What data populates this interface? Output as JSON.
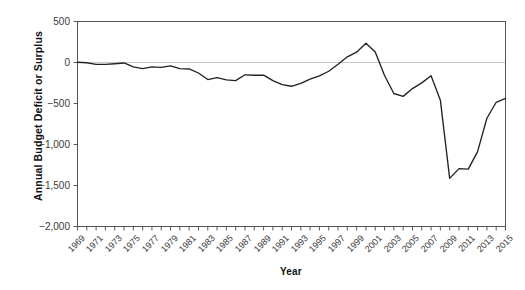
{
  "chart_data": {
    "type": "line",
    "title": "",
    "xlabel": "Year",
    "ylabel": "Annual Budget Deficit or Surplus",
    "xlim": [
      1969,
      2015
    ],
    "ylim": [
      -2000,
      500
    ],
    "grid": false,
    "legend": "none",
    "y_ticks": [
      500,
      0,
      -500,
      -1000,
      -1500,
      -2000
    ],
    "y_tick_labels": [
      "500",
      "0",
      "−500",
      "−1,000",
      "−1,500",
      "−2,000"
    ],
    "x_tick_labels": [
      "1969",
      "1971",
      "1973",
      "1975",
      "1977",
      "1979",
      "1981",
      "1983",
      "1985",
      "1987",
      "1989",
      "1991",
      "1993",
      "1995",
      "1997",
      "1999",
      "2001",
      "2003",
      "2005",
      "2007",
      "2009",
      "2011",
      "2013",
      "2015"
    ],
    "x_tick_label_step": 2,
    "series": [
      {
        "name": "Annual Budget Deficit or Surplus",
        "color": "#222222",
        "x": [
          1969,
          1970,
          1971,
          1972,
          1973,
          1974,
          1975,
          1976,
          1977,
          1978,
          1979,
          1980,
          1981,
          1982,
          1983,
          1984,
          1985,
          1986,
          1987,
          1988,
          1989,
          1990,
          1991,
          1992,
          1993,
          1994,
          1995,
          1996,
          1997,
          1998,
          1999,
          2000,
          2001,
          2002,
          2003,
          2004,
          2005,
          2006,
          2007,
          2008,
          2009,
          2010,
          2011,
          2012,
          2013,
          2014,
          2015
        ],
        "values": [
          3,
          -3,
          -23,
          -23,
          -15,
          -6,
          -53,
          -74,
          -54,
          -59,
          -41,
          -74,
          -79,
          -128,
          -208,
          -185,
          -212,
          -221,
          -150,
          -155,
          -153,
          -221,
          -269,
          -290,
          -255,
          -203,
          -164,
          -107,
          -22,
          69,
          126,
          236,
          128,
          -158,
          -378,
          -413,
          -318,
          -248,
          -161,
          -459,
          -1413,
          -1294,
          -1300,
          -1087,
          -680,
          -485,
          -438
        ]
      }
    ]
  },
  "axis": {
    "y_title": "Annual Budget Deficit or Surplus",
    "x_title": "Year"
  }
}
